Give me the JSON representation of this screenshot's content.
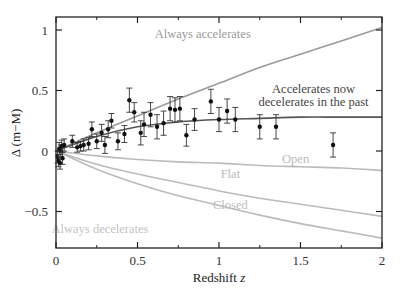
{
  "chart_data": {
    "type": "scatter",
    "title": "",
    "xlabel": "Redshift z",
    "ylabel": "Δ (m−M)",
    "xlim": [
      0,
      2
    ],
    "ylim": [
      -0.8,
      1.1
    ],
    "grid": false,
    "legend": "none (inline curve labels)",
    "x_ticks": [
      {
        "value": 0,
        "label": "0"
      },
      {
        "value": 0.5,
        "label": "0.5"
      },
      {
        "value": 1,
        "label": "1"
      },
      {
        "value": 1.5,
        "label": "1.5"
      },
      {
        "value": 2,
        "label": "2"
      }
    ],
    "x_minor_ticks": [
      0.25,
      0.75,
      1.25,
      1.75
    ],
    "y_ticks": [
      {
        "value": 1,
        "label": "1"
      },
      {
        "value": 0.5,
        "label": "0.5"
      },
      {
        "value": 0,
        "label": "0"
      },
      {
        "value": -0.5,
        "label": "−0.5"
      }
    ],
    "series": [
      {
        "name": "Supernova data",
        "kind": "points_with_errorbars",
        "color": "#111111",
        "points": [
          {
            "x": 0.01,
            "y": -0.05,
            "err": 0.05
          },
          {
            "x": 0.015,
            "y": -0.08,
            "err": 0.05
          },
          {
            "x": 0.02,
            "y": 0.02,
            "err": 0.05
          },
          {
            "x": 0.025,
            "y": -0.1,
            "err": 0.05
          },
          {
            "x": 0.03,
            "y": 0.0,
            "err": 0.05
          },
          {
            "x": 0.035,
            "y": 0.04,
            "err": 0.05
          },
          {
            "x": 0.04,
            "y": -0.06,
            "err": 0.05
          },
          {
            "x": 0.05,
            "y": 0.05,
            "err": 0.05
          },
          {
            "x": 0.1,
            "y": 0.08,
            "err": 0.05
          },
          {
            "x": 0.13,
            "y": 0.03,
            "err": 0.04
          },
          {
            "x": 0.15,
            "y": 0.04,
            "err": 0.04
          },
          {
            "x": 0.17,
            "y": 0.05,
            "err": 0.05
          },
          {
            "x": 0.2,
            "y": 0.06,
            "err": 0.05
          },
          {
            "x": 0.22,
            "y": 0.18,
            "err": 0.06
          },
          {
            "x": 0.25,
            "y": 0.08,
            "err": 0.06
          },
          {
            "x": 0.28,
            "y": 0.15,
            "err": 0.07
          },
          {
            "x": 0.3,
            "y": 0.05,
            "err": 0.07
          },
          {
            "x": 0.32,
            "y": 0.18,
            "err": 0.07
          },
          {
            "x": 0.34,
            "y": 0.25,
            "err": 0.06
          },
          {
            "x": 0.38,
            "y": 0.08,
            "err": 0.07
          },
          {
            "x": 0.42,
            "y": 0.14,
            "err": 0.07
          },
          {
            "x": 0.45,
            "y": 0.42,
            "err": 0.1
          },
          {
            "x": 0.48,
            "y": 0.32,
            "err": 0.08
          },
          {
            "x": 0.52,
            "y": 0.15,
            "err": 0.1
          },
          {
            "x": 0.54,
            "y": 0.22,
            "err": 0.1
          },
          {
            "x": 0.58,
            "y": 0.3,
            "err": 0.1
          },
          {
            "x": 0.62,
            "y": 0.2,
            "err": 0.1
          },
          {
            "x": 0.66,
            "y": 0.23,
            "err": 0.1
          },
          {
            "x": 0.7,
            "y": 0.35,
            "err": 0.1
          },
          {
            "x": 0.73,
            "y": 0.34,
            "err": 0.1
          },
          {
            "x": 0.76,
            "y": 0.35,
            "err": 0.1
          },
          {
            "x": 0.8,
            "y": 0.13,
            "err": 0.09
          },
          {
            "x": 0.85,
            "y": 0.26,
            "err": 0.09
          },
          {
            "x": 0.95,
            "y": 0.41,
            "err": 0.1
          },
          {
            "x": 1.0,
            "y": 0.26,
            "err": 0.1
          },
          {
            "x": 1.05,
            "y": 0.33,
            "err": 0.1
          },
          {
            "x": 1.1,
            "y": 0.26,
            "err": 0.1
          },
          {
            "x": 1.25,
            "y": 0.2,
            "err": 0.1
          },
          {
            "x": 1.35,
            "y": 0.2,
            "err": 0.1
          },
          {
            "x": 1.7,
            "y": 0.05,
            "err": 0.1
          }
        ]
      },
      {
        "name": "Always accelerates",
        "kind": "curve",
        "color": "#9a9a9a",
        "x": [
          0,
          0.25,
          0.5,
          0.75,
          1.0,
          1.25,
          1.5,
          1.75,
          2.0
        ],
        "y": [
          0,
          0.15,
          0.29,
          0.43,
          0.56,
          0.69,
          0.8,
          0.91,
          1.02
        ]
      },
      {
        "name": "Accelerates now decelerates in the past",
        "kind": "curve",
        "color": "#555555",
        "x": [
          0,
          0.25,
          0.5,
          0.75,
          1.0,
          1.25,
          1.5,
          1.75,
          2.0
        ],
        "y": [
          0,
          0.12,
          0.2,
          0.24,
          0.26,
          0.27,
          0.28,
          0.28,
          0.28
        ]
      },
      {
        "name": "Open",
        "kind": "curve",
        "color": "#bbbbbb",
        "x": [
          0,
          0.25,
          0.5,
          0.75,
          1.0,
          1.25,
          1.5,
          1.75,
          2.0
        ],
        "y": [
          0,
          -0.04,
          -0.07,
          -0.09,
          -0.1,
          -0.12,
          -0.13,
          -0.14,
          -0.16
        ]
      },
      {
        "name": "Flat",
        "kind": "curve",
        "color": "#bbbbbb",
        "x": [
          0,
          0.25,
          0.5,
          0.75,
          1.0,
          1.25,
          1.5,
          1.75,
          2.0
        ],
        "y": [
          0,
          -0.11,
          -0.19,
          -0.26,
          -0.33,
          -0.39,
          -0.44,
          -0.49,
          -0.54
        ]
      },
      {
        "name": "Closed",
        "kind": "curve",
        "color": "#bbbbbb",
        "x": [
          0,
          0.25,
          0.5,
          0.75,
          1.0,
          1.25,
          1.5,
          1.75,
          2.0
        ],
        "y": [
          0,
          -0.15,
          -0.27,
          -0.37,
          -0.45,
          -0.53,
          -0.6,
          -0.66,
          -0.72
        ]
      }
    ],
    "annotations": [
      {
        "text": "Always accelerates",
        "x": 0.9,
        "y": 0.93,
        "color": "#9a9a9a"
      },
      {
        "text": "Accelerates now",
        "x": 1.58,
        "y": 0.48,
        "color": "#444444"
      },
      {
        "text": "decelerates in the past",
        "x": 1.58,
        "y": 0.37,
        "color": "#444444"
      },
      {
        "text": "Open",
        "x": 1.47,
        "y": -0.1,
        "color": "#bbbbbb"
      },
      {
        "text": "Flat",
        "x": 1.07,
        "y": -0.22,
        "color": "#bbbbbb"
      },
      {
        "text": "Closed",
        "x": 1.07,
        "y": -0.48,
        "color": "#bbbbbb"
      },
      {
        "text": "Always decelerates",
        "x": 0.27,
        "y": -0.68,
        "color": "#c4c4c4"
      }
    ]
  }
}
